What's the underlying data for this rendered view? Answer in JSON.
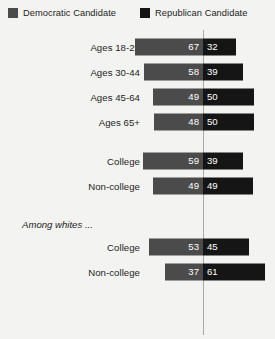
{
  "legend": {
    "items": [
      {
        "label": "Democratic Candidate",
        "icon": "square-swatch-icon",
        "color": "#4b4b4b"
      },
      {
        "label": "Republican Candidate",
        "icon": "square-swatch-icon",
        "color": "#151515"
      }
    ]
  },
  "section_note": "Among whites ...",
  "chart_data": {
    "type": "bar",
    "subtype": "diverging-stacked-bar",
    "title": "",
    "xlabel": "",
    "ylabel": "",
    "grid": false,
    "legend_position": "top",
    "center_line": true,
    "categories": [
      "Ages 18-29",
      "Ages 30-44",
      "Ages 45-64",
      "Ages 65+",
      "College",
      "Non-college",
      "College",
      "Non-college"
    ],
    "series": [
      {
        "name": "Democratic Candidate",
        "color": "#4b4b4b",
        "side": "left",
        "values": [
          67,
          58,
          49,
          48,
          59,
          49,
          53,
          37
        ]
      },
      {
        "name": "Republican Candidate",
        "color": "#151515",
        "side": "right",
        "values": [
          32,
          39,
          50,
          50,
          39,
          49,
          45,
          61
        ]
      }
    ],
    "groups": [
      {
        "note": "",
        "categories": [
          "Ages 18-29",
          "Ages 30-44",
          "Ages 45-64",
          "Ages 65+"
        ]
      },
      {
        "note": "",
        "categories": [
          "College",
          "Non-college"
        ]
      },
      {
        "note": "Among whites ...",
        "categories": [
          "College",
          "Non-college"
        ]
      }
    ],
    "xlim": [
      0,
      70
    ]
  },
  "rows": [
    {
      "label": "Ages 18-29",
      "left": 67,
      "right": 32,
      "gap": false
    },
    {
      "label": "Ages 30-44",
      "left": 58,
      "right": 39,
      "gap": false
    },
    {
      "label": "Ages 45-64",
      "left": 49,
      "right": 50,
      "gap": false
    },
    {
      "label": "Ages 65+",
      "left": 48,
      "right": 50,
      "gap": false
    },
    {
      "label": "College",
      "left": 59,
      "right": 39,
      "gap": true
    },
    {
      "label": "Non-college",
      "left": 49,
      "right": 49,
      "gap": false
    },
    {
      "label": "College",
      "left": 53,
      "right": 45,
      "gap": false
    },
    {
      "label": "Non-college",
      "left": 37,
      "right": 61,
      "gap": false
    }
  ],
  "colors": {
    "background": "#f3f3f1",
    "democratic": "#4b4b4b",
    "republican": "#151515",
    "divider": "#a9a9a7",
    "text": "#1d1d1d",
    "value_text": "#ffffff"
  }
}
